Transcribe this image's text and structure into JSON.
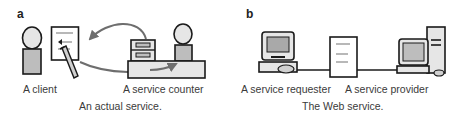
{
  "panels": [
    {
      "letter": "a",
      "labels": {
        "left": "A client",
        "right": "A service counter"
      },
      "caption": "An actual service."
    },
    {
      "letter": "b",
      "labels": {
        "left": "A service requester",
        "right": "A service provider"
      },
      "caption": "The Web service."
    }
  ],
  "colors": {
    "outline": "#1a1a1a",
    "fill_light": "#e6e6e6",
    "fill_mid": "#bdbdbd",
    "fill_screen": "#a9a9a9",
    "arrow": "#6e6e6e",
    "paper": "#ffffff"
  },
  "icons": {
    "panel_a": [
      "person-client-icon",
      "form-document-icon",
      "pencil-icon",
      "curved-arrow-left-icon",
      "curved-arrow-right-icon",
      "file-cabinet-icon",
      "counter-desk-icon",
      "person-clerk-icon"
    ],
    "panel_b": [
      "desktop-computer-requester-icon",
      "message-document-icon",
      "tower-computer-provider-icon",
      "connection-line"
    ]
  }
}
